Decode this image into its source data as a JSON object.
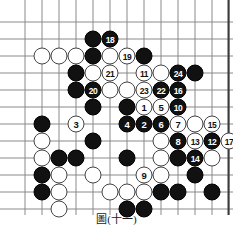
{
  "figure": {
    "type": "go-board-diagram",
    "caption": "圖(十一)",
    "board": {
      "columns": 12,
      "rows": 12,
      "origin_x": 25,
      "origin_y": 22,
      "spacing": 17,
      "line_color": "#8a8a8a",
      "border_color": "#3a3a3a",
      "background": "#ffffff"
    },
    "colors": {
      "black_stone": "#111111",
      "white_stone": "#ffffff",
      "black_label": "#ffffff",
      "white_label": "#111111"
    }
  },
  "chart_data": {
    "type": "table",
    "title": "圖(十一)",
    "xlabel": "board column (1-12)",
    "ylabel": "board row (1-12)",
    "legend": [
      "black stone",
      "white stone",
      "numbered move"
    ],
    "stones": [
      {
        "col": 5,
        "row": 2,
        "color": "black",
        "label": ""
      },
      {
        "col": 6,
        "row": 2,
        "color": "black",
        "label": "18"
      },
      {
        "col": 2,
        "row": 3,
        "color": "white",
        "label": ""
      },
      {
        "col": 3,
        "row": 3,
        "color": "white",
        "label": ""
      },
      {
        "col": 4,
        "row": 3,
        "color": "white",
        "label": ""
      },
      {
        "col": 5,
        "row": 3,
        "color": "black",
        "label": ""
      },
      {
        "col": 6,
        "row": 3,
        "color": "white",
        "label": ""
      },
      {
        "col": 7,
        "row": 3,
        "color": "white",
        "label": "19"
      },
      {
        "col": 8,
        "row": 3,
        "color": "black",
        "label": ""
      },
      {
        "col": 4,
        "row": 4,
        "color": "black",
        "label": ""
      },
      {
        "col": 5,
        "row": 4,
        "color": "white",
        "label": ""
      },
      {
        "col": 6,
        "row": 4,
        "color": "white",
        "label": "21"
      },
      {
        "col": 8,
        "row": 4,
        "color": "white",
        "label": "11"
      },
      {
        "col": 9,
        "row": 4,
        "color": "white",
        "label": ""
      },
      {
        "col": 10,
        "row": 4,
        "color": "black",
        "label": "24"
      },
      {
        "col": 11,
        "row": 4,
        "color": "black",
        "label": ""
      },
      {
        "col": 4,
        "row": 5,
        "color": "black",
        "label": ""
      },
      {
        "col": 5,
        "row": 5,
        "color": "black",
        "label": "20"
      },
      {
        "col": 6,
        "row": 5,
        "color": "white",
        "label": ""
      },
      {
        "col": 7,
        "row": 5,
        "color": "white",
        "label": ""
      },
      {
        "col": 8,
        "row": 5,
        "color": "white",
        "label": "23"
      },
      {
        "col": 9,
        "row": 5,
        "color": "black",
        "label": "22"
      },
      {
        "col": 10,
        "row": 5,
        "color": "black",
        "label": "16"
      },
      {
        "col": 5,
        "row": 6,
        "color": "black",
        "label": ""
      },
      {
        "col": 7,
        "row": 6,
        "color": "black",
        "label": ""
      },
      {
        "col": 8,
        "row": 6,
        "color": "white",
        "label": "1"
      },
      {
        "col": 9,
        "row": 6,
        "color": "white",
        "label": "5"
      },
      {
        "col": 10,
        "row": 6,
        "color": "black",
        "label": "10"
      },
      {
        "col": 2,
        "row": 7,
        "color": "black",
        "label": ""
      },
      {
        "col": 4,
        "row": 7,
        "color": "white",
        "label": "3"
      },
      {
        "col": 7,
        "row": 7,
        "color": "black",
        "label": "4"
      },
      {
        "col": 8,
        "row": 7,
        "color": "black",
        "label": "2"
      },
      {
        "col": 9,
        "row": 7,
        "color": "black",
        "label": "6"
      },
      {
        "col": 10,
        "row": 7,
        "color": "white",
        "label": "7"
      },
      {
        "col": 11,
        "row": 7,
        "color": "white",
        "label": ""
      },
      {
        "col": 12,
        "row": 7,
        "color": "white",
        "label": "15"
      },
      {
        "col": 2,
        "row": 8,
        "color": "white",
        "label": ""
      },
      {
        "col": 5,
        "row": 8,
        "color": "black",
        "label": ""
      },
      {
        "col": 9,
        "row": 8,
        "color": "white",
        "label": ""
      },
      {
        "col": 10,
        "row": 8,
        "color": "black",
        "label": "8"
      },
      {
        "col": 11,
        "row": 8,
        "color": "white",
        "label": "13"
      },
      {
        "col": 12,
        "row": 8,
        "color": "black",
        "label": "12"
      },
      {
        "col": 13,
        "row": 8,
        "color": "white",
        "label": "17"
      },
      {
        "col": 2,
        "row": 9,
        "color": "white",
        "label": ""
      },
      {
        "col": 3,
        "row": 9,
        "color": "black",
        "label": ""
      },
      {
        "col": 4,
        "row": 9,
        "color": "black",
        "label": ""
      },
      {
        "col": 7,
        "row": 9,
        "color": "black",
        "label": ""
      },
      {
        "col": 9,
        "row": 9,
        "color": "white",
        "label": ""
      },
      {
        "col": 10,
        "row": 9,
        "color": "black",
        "label": ""
      },
      {
        "col": 11,
        "row": 9,
        "color": "black",
        "label": "14"
      },
      {
        "col": 12,
        "row": 9,
        "color": "white",
        "label": ""
      },
      {
        "col": 2,
        "row": 10,
        "color": "black",
        "label": ""
      },
      {
        "col": 3,
        "row": 10,
        "color": "white",
        "label": ""
      },
      {
        "col": 5,
        "row": 10,
        "color": "white",
        "label": ""
      },
      {
        "col": 8,
        "row": 10,
        "color": "white",
        "label": "9"
      },
      {
        "col": 9,
        "row": 10,
        "color": "white",
        "label": ""
      },
      {
        "col": 11,
        "row": 10,
        "color": "black",
        "label": ""
      },
      {
        "col": 2,
        "row": 11,
        "color": "black",
        "label": ""
      },
      {
        "col": 3,
        "row": 11,
        "color": "white",
        "label": ""
      },
      {
        "col": 6,
        "row": 11,
        "color": "white",
        "label": ""
      },
      {
        "col": 7,
        "row": 11,
        "color": "white",
        "label": ""
      },
      {
        "col": 8,
        "row": 11,
        "color": "white",
        "label": ""
      },
      {
        "col": 9,
        "row": 11,
        "color": "black",
        "label": ""
      },
      {
        "col": 10,
        "row": 11,
        "color": "black",
        "label": ""
      },
      {
        "col": 12,
        "row": 11,
        "color": "black",
        "label": ""
      },
      {
        "col": 3,
        "row": 12,
        "color": "white",
        "label": ""
      },
      {
        "col": 7,
        "row": 12,
        "color": "black",
        "label": ""
      },
      {
        "col": 8,
        "row": 12,
        "color": "black",
        "label": ""
      }
    ]
  }
}
